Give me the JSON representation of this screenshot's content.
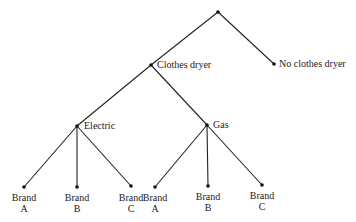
{
  "diagram": {
    "type": "tree",
    "nodes": {
      "root": {
        "label": ""
      },
      "dryer": {
        "label": "Clothes dryer"
      },
      "no_dryer": {
        "label": "No clothes dryer"
      },
      "electric": {
        "label": "Electric"
      },
      "gas": {
        "label": "Gas"
      },
      "e_a": {
        "line1": "Brand",
        "line2": "A"
      },
      "e_b": {
        "line1": "Brand",
        "line2": "B"
      },
      "e_c": {
        "line1": "Brand",
        "line2": "C"
      },
      "g_a": {
        "line1": "Brand",
        "line2": "A"
      },
      "g_b": {
        "line1": "Brand",
        "line2": "B"
      },
      "g_c": {
        "line1": "Brand",
        "line2": "C"
      }
    },
    "edges": [
      [
        "root",
        "dryer"
      ],
      [
        "root",
        "no_dryer"
      ],
      [
        "dryer",
        "electric"
      ],
      [
        "dryer",
        "gas"
      ],
      [
        "electric",
        "e_a"
      ],
      [
        "electric",
        "e_b"
      ],
      [
        "electric",
        "e_c"
      ],
      [
        "gas",
        "g_a"
      ],
      [
        "gas",
        "g_b"
      ],
      [
        "gas",
        "g_c"
      ]
    ],
    "line_color": "#222222"
  }
}
